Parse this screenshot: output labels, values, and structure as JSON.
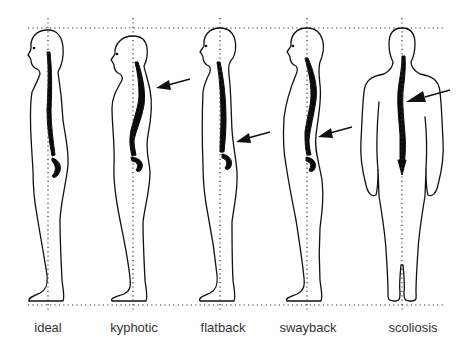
{
  "figures": [
    {
      "id": "ideal",
      "label": "ideal",
      "has_arrow": false
    },
    {
      "id": "kyphotic",
      "label": "kyphotic",
      "has_arrow": true,
      "arrow_target": "upper back"
    },
    {
      "id": "flatback",
      "label": "flatback",
      "has_arrow": true,
      "arrow_target": "lower back"
    },
    {
      "id": "swayback",
      "label": "swayback",
      "has_arrow": true,
      "arrow_target": "lower back"
    },
    {
      "id": "scoliosis",
      "label": "scoliosis",
      "has_arrow": true,
      "arrow_target": "mid spine"
    }
  ],
  "colors": {
    "line": "#111111",
    "background": "#ffffff",
    "label": "#333333"
  }
}
